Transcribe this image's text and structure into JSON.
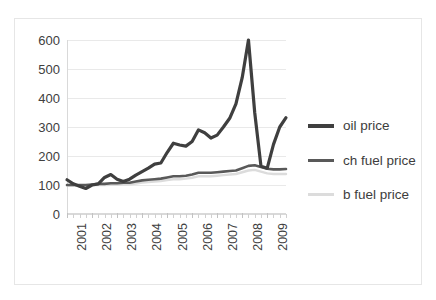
{
  "chart_data": {
    "type": "line",
    "title": "",
    "xlabel": "",
    "ylabel": "",
    "ylim": [
      0,
      600
    ],
    "yticks": [
      0,
      100,
      200,
      300,
      400,
      500,
      600
    ],
    "ytick_labels": [
      "0",
      "100",
      "200",
      "300",
      "400",
      "500",
      "600"
    ],
    "grid": true,
    "legend_position": "right",
    "x_label_rotation": -90,
    "categories": [
      "2001 Q1",
      "2001 Q2",
      "2001 Q3",
      "2001 Q4",
      "2002 Q1",
      "2002 Q2",
      "2002 Q3",
      "2002 Q4",
      "2003 Q1",
      "2003 Q2",
      "2003 Q3",
      "2003 Q4",
      "2004 Q1",
      "2004 Q2",
      "2004 Q3",
      "2004 Q4",
      "2005 Q1",
      "2005 Q2",
      "2005 Q3",
      "2005 Q4",
      "2006 Q1",
      "2006 Q2",
      "2006 Q3",
      "2006 Q4",
      "2007 Q1",
      "2007 Q2",
      "2007 Q3",
      "2007 Q4",
      "2008 Q1",
      "2008 Q2",
      "2008 Q3",
      "2008 Q4",
      "2009 Q1",
      "2009 Q2",
      "2009 Q3",
      "2009 Q4"
    ],
    "xtick_labels": [
      "2001",
      "2002",
      "2003",
      "2004",
      "2005",
      "2006",
      "2007",
      "2008",
      "2009"
    ],
    "series": [
      {
        "name": "oil price",
        "color": "#3f3f3f",
        "width": 3.2,
        "values": [
          118,
          104,
          96,
          88,
          100,
          104,
          126,
          136,
          120,
          112,
          120,
          134,
          146,
          158,
          172,
          176,
          212,
          244,
          238,
          234,
          250,
          290,
          280,
          262,
          272,
          300,
          330,
          380,
          470,
          600,
          350,
          165,
          158,
          240,
          300,
          332
        ]
      },
      {
        "name": "ch fuel price",
        "color": "#595959",
        "width": 2.6,
        "values": [
          100,
          100,
          100,
          100,
          102,
          104,
          104,
          106,
          106,
          108,
          108,
          112,
          116,
          118,
          120,
          122,
          126,
          130,
          130,
          132,
          136,
          142,
          142,
          142,
          144,
          146,
          148,
          150,
          158,
          166,
          168,
          162,
          156,
          154,
          154,
          155
        ]
      },
      {
        "name": "b fuel price",
        "color": "#dcdcdc",
        "width": 2.4,
        "values": [
          98,
          98,
          98,
          98,
          99,
          100,
          100,
          101,
          101,
          102,
          102,
          105,
          108,
          110,
          112,
          114,
          117,
          120,
          120,
          122,
          125,
          130,
          130,
          130,
          132,
          134,
          136,
          138,
          144,
          150,
          152,
          146,
          140,
          138,
          138,
          138
        ]
      }
    ]
  },
  "legend": {
    "items": [
      {
        "label": "oil price",
        "color": "#3f3f3f",
        "width": 4
      },
      {
        "label": "ch fuel price",
        "color": "#595959",
        "width": 3
      },
      {
        "label": "b fuel price",
        "color": "#dcdcdc",
        "width": 3
      }
    ]
  }
}
